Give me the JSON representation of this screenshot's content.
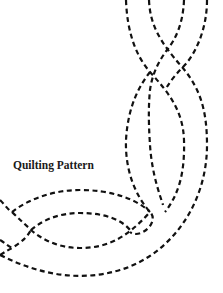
{
  "figure": {
    "title": "Quilting Pattern",
    "background": "#ffffff",
    "stroke_color": "#111111",
    "line_style": "dashed",
    "elements": [
      "braided-vertical-cables",
      "curved-lens-loops"
    ]
  }
}
